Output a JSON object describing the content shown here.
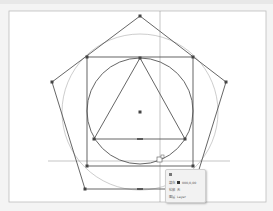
{
  "app": {
    "view": "drawing-canvas"
  },
  "canvas": {
    "shapes": [
      {
        "type": "pentagon",
        "name": "pentagon"
      },
      {
        "type": "square",
        "name": "square"
      },
      {
        "type": "circle",
        "name": "inscribed-circle"
      },
      {
        "type": "circle",
        "name": "circumscribed-circle"
      },
      {
        "type": "triangle",
        "name": "triangle"
      }
    ],
    "guides": {
      "vertical": 1,
      "horizontal": 1
    },
    "colors": {
      "stroke": "#555555",
      "thin_stroke": "#8a8a8a",
      "guide": "#7a7a7a",
      "page_border": "#bdbdbd",
      "background": "#ffffff"
    }
  },
  "tooltip": {
    "rows": [
      {
        "label": "填充",
        "value": "000,0,00"
      },
      {
        "label": "轮廓",
        "value": "无"
      },
      {
        "label": "图层",
        "value": "Layer"
      }
    ]
  }
}
